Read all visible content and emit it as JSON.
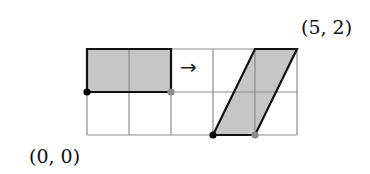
{
  "diagram": {
    "type": "linear-transformation-grid",
    "grid": {
      "columns": 5,
      "rows": 2,
      "origin_px": [
        87,
        135
      ],
      "cell_w": 42,
      "cell_h": 43
    },
    "labels": {
      "origin": "(0, 0)",
      "end": "(5, 2)"
    },
    "arrow": "→",
    "source_shape": {
      "name": "rectangle",
      "vertices": [
        [
          0,
          1
        ],
        [
          2,
          1
        ],
        [
          2,
          2
        ],
        [
          0,
          2
        ]
      ],
      "marked_points": [
        {
          "point": [
            0,
            1
          ],
          "color": "#000000"
        },
        {
          "point": [
            2,
            1
          ],
          "color": "#8a8a8a"
        }
      ]
    },
    "image_shape": {
      "name": "parallelogram",
      "vertices": [
        [
          3,
          0
        ],
        [
          4,
          0
        ],
        [
          5,
          2
        ],
        [
          4,
          2
        ]
      ],
      "marked_points": [
        {
          "point": [
            3,
            0
          ],
          "color": "#000000"
        },
        {
          "point": [
            4,
            0
          ],
          "color": "#8a8a8a"
        }
      ]
    },
    "colors": {
      "fill": "#c6c6c6",
      "grid_line": "#8c8c8c",
      "outline": "#111111"
    }
  }
}
